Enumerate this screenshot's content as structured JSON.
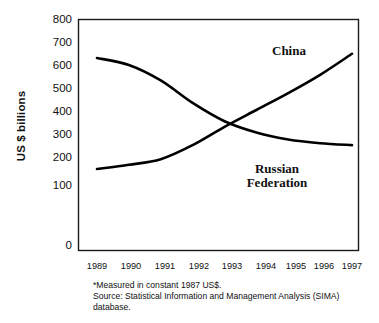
{
  "chart_data": {
    "type": "line",
    "title": "",
    "xlabel": "",
    "ylabel": "US $ billions",
    "x": [
      1989,
      1990,
      1991,
      1992,
      1993,
      1994,
      1995,
      1996,
      1997
    ],
    "xticklabels": [
      "1989",
      "1990",
      "1991",
      "1992",
      "1993",
      "1994",
      "1995",
      "1996",
      "1997"
    ],
    "yticklabels": [
      "0",
      "100",
      "200",
      "300",
      "400",
      "500",
      "600",
      "700",
      "800"
    ],
    "yticks": [
      0,
      100,
      200,
      300,
      400,
      500,
      600,
      700,
      800
    ],
    "ylim": [
      0,
      800
    ],
    "xlim": [
      1989,
      1997
    ],
    "grid": false,
    "legend": "inline-annotations",
    "series": [
      {
        "name": "Russian Federation",
        "color": "#000000",
        "values": [
          665,
          640,
          585,
          505,
          440,
          400,
          375,
          362,
          355
        ]
      },
      {
        "name": "China",
        "color": "#000000",
        "values": [
          270,
          285,
          305,
          355,
          420,
          480,
          540,
          605,
          680
        ]
      }
    ],
    "annotations": [
      {
        "text": "China",
        "x": 1996.1,
        "y": 720
      },
      {
        "text": "Russian Federation",
        "x": 1994.7,
        "y": 270
      }
    ],
    "crossing_point": {
      "x": 1993.3,
      "y": 440
    }
  },
  "axes": {
    "ylabel": "US $ billions",
    "yticks": [
      "800",
      "700",
      "600",
      "500",
      "400",
      "300",
      "200",
      "100",
      "0"
    ],
    "xticks": [
      "1989",
      "1990",
      "1991",
      "1992",
      "1993",
      "1994",
      "1995",
      "1996",
      "1997"
    ]
  },
  "labels": {
    "china": "China",
    "russia_line1": "Russian",
    "russia_line2": "Federation"
  },
  "footnote": {
    "line1": "*Measured in constant 1987 US$.",
    "line2": "Source: Statistical Information and Management Analysis (SIMA)",
    "line3": "database."
  }
}
